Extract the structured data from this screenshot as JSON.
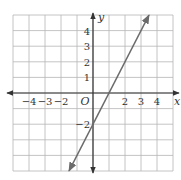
{
  "chart_data": {
    "type": "line",
    "title": "",
    "xlabel": "x",
    "ylabel": "y",
    "origin_label": "O",
    "xlim": [
      -5,
      5
    ],
    "ylim": [
      -5,
      5
    ],
    "grid": true,
    "x_tick_labels": [
      {
        "value": -4,
        "label": "−4"
      },
      {
        "value": -3,
        "label": "−3"
      },
      {
        "value": -2,
        "label": "−2"
      },
      {
        "value": 2,
        "label": "2"
      },
      {
        "value": 3,
        "label": "3"
      },
      {
        "value": 4,
        "label": "4"
      }
    ],
    "y_tick_labels": [
      {
        "value": 4,
        "label": "4"
      },
      {
        "value": 3,
        "label": "3"
      },
      {
        "value": 2,
        "label": "2"
      },
      {
        "value": 1,
        "label": "1"
      },
      {
        "value": -2,
        "label": "−2"
      }
    ],
    "series": [
      {
        "name": "y = 2x − 2",
        "slope": 2,
        "intercept": -2,
        "x": [
          -1.5,
          0,
          1,
          2,
          3,
          3.5
        ],
        "y": [
          -5,
          -2,
          0,
          2,
          4,
          5
        ],
        "arrows": "both"
      }
    ]
  },
  "colors": {
    "grid": "#b5b5b5",
    "axis": "#333333",
    "line": "#6b6b6b"
  }
}
